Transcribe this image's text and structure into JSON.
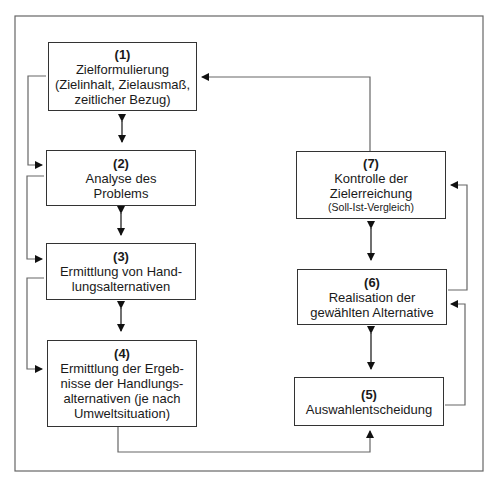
{
  "diagram": {
    "boxes": [
      {
        "id": "1",
        "num": "(1)",
        "lines": [
          "Zielformulierung",
          "(Zielinhalt, Zielausmaß,",
          "zeitlicher Bezug)"
        ]
      },
      {
        "id": "2",
        "num": "(2)",
        "lines": [
          "Analyse des",
          "Problems"
        ]
      },
      {
        "id": "3",
        "num": "(3)",
        "lines": [
          "Ermittlung von Hand-",
          "lungsalternativen"
        ]
      },
      {
        "id": "4",
        "num": "(4)",
        "lines": [
          "Ermittlung der Ergeb-",
          "nisse der Handlungs-",
          "alternativen (je nach",
          "Umweltsituation)"
        ]
      },
      {
        "id": "5",
        "num": "(5)",
        "lines": [
          "Auswahlentscheidung"
        ]
      },
      {
        "id": "6",
        "num": "(6)",
        "lines": [
          "Realisation der",
          "gewählten Alternative"
        ]
      },
      {
        "id": "7",
        "num": "(7)",
        "lines": [
          "Kontrolle der",
          "Zielerreichung"
        ],
        "note": "(Soll-Ist-Vergleich)"
      }
    ],
    "colors": {
      "line": "#555555",
      "border": "#333333",
      "text": "#1a1a1a"
    }
  }
}
